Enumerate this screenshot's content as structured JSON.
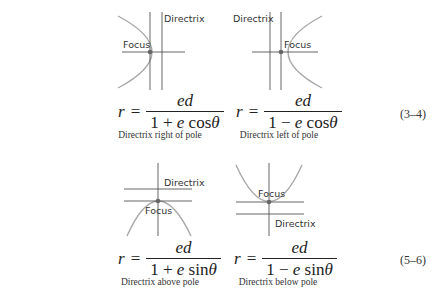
{
  "colors": {
    "panel_bg": "#f6f6f6",
    "axis": "#555555",
    "curve": "#a8a8a8",
    "focus_dot": "#666666"
  },
  "labels": {
    "directrix": "Directrix",
    "focus": "Focus"
  },
  "rows": [
    {
      "equation_number": "(3–4)",
      "panels": [
        {
          "lhs": "r",
          "eq": "=",
          "numerator": "ed",
          "denominator": {
            "one": "1",
            "op": "+",
            "e": "e",
            "func": "cos",
            "theta": "θ"
          },
          "caption": "Directrix right of pole"
        },
        {
          "lhs": "r",
          "eq": "=",
          "numerator": "ed",
          "denominator": {
            "one": "1",
            "op": "−",
            "e": "e",
            "func": "cos",
            "theta": "θ"
          },
          "caption": "Directrix left of pole"
        }
      ]
    },
    {
      "equation_number": "(5–6)",
      "panels": [
        {
          "lhs": "r",
          "eq": "=",
          "numerator": "ed",
          "denominator": {
            "one": "1",
            "op": "+",
            "e": "e",
            "func": "sin",
            "theta": "θ"
          },
          "caption": "Directrix above pole"
        },
        {
          "lhs": "r",
          "eq": "=",
          "numerator": "ed",
          "denominator": {
            "one": "1",
            "op": "−",
            "e": "e",
            "func": "sin",
            "theta": "θ"
          },
          "caption": "Directrix below pole"
        }
      ]
    }
  ]
}
